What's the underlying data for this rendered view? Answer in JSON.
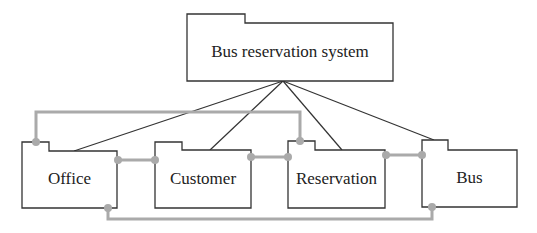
{
  "diagram": {
    "type": "package-diagram",
    "root": {
      "label": "Bus reservation system",
      "tab": {
        "x": 187,
        "y": 14,
        "w": 58,
        "h": 9
      },
      "body": {
        "x": 187,
        "y": 23,
        "w": 206,
        "h": 58
      }
    },
    "packages": [
      {
        "id": "office",
        "label": "Office",
        "tab": {
          "x": 22,
          "y": 142,
          "w": 27,
          "h": 9
        },
        "body": {
          "x": 22,
          "y": 151,
          "w": 95,
          "h": 57
        }
      },
      {
        "id": "customer",
        "label": "Customer",
        "tab": {
          "x": 155,
          "y": 142,
          "w": 27,
          "h": 8
        },
        "body": {
          "x": 155,
          "y": 150,
          "w": 96,
          "h": 58
        }
      },
      {
        "id": "reservation",
        "label": "Reservation",
        "tab": {
          "x": 288,
          "y": 141,
          "w": 27,
          "h": 9
        },
        "body": {
          "x": 288,
          "y": 150,
          "w": 97,
          "h": 58
        }
      },
      {
        "id": "bus",
        "label": "Bus",
        "tab": {
          "x": 422,
          "y": 140,
          "w": 26,
          "h": 10
        },
        "body": {
          "x": 422,
          "y": 150,
          "w": 95,
          "h": 57
        }
      }
    ],
    "containment_edges": [
      {
        "from": "root",
        "to": "office",
        "from_pt": [
          283,
          81
        ],
        "to_pt": [
          74,
          151
        ]
      },
      {
        "from": "root",
        "to": "customer",
        "from_pt": [
          283,
          81
        ],
        "to_pt": [
          210,
          150
        ]
      },
      {
        "from": "root",
        "to": "reservation",
        "from_pt": [
          283,
          81
        ],
        "to_pt": [
          342,
          150
        ]
      },
      {
        "from": "root",
        "to": "bus",
        "from_pt": [
          283,
          81
        ],
        "to_pt": [
          434,
          140
        ]
      }
    ],
    "dependency_edges": [
      {
        "from": "office",
        "to": "customer",
        "points": [
          [
            118,
            160
          ],
          [
            155,
            160
          ]
        ]
      },
      {
        "from": "customer",
        "to": "reservation",
        "points": [
          [
            251,
            157
          ],
          [
            288,
            157
          ]
        ]
      },
      {
        "from": "reservation",
        "to": "bus",
        "points": [
          [
            386,
            155
          ],
          [
            422,
            155
          ]
        ]
      },
      {
        "from": "office",
        "to": "reservation",
        "points": [
          [
            36,
            142
          ],
          [
            36,
            112
          ],
          [
            300,
            112
          ],
          [
            300,
            141
          ]
        ]
      },
      {
        "from": "office",
        "to": "bus",
        "points": [
          [
            108,
            208
          ],
          [
            108,
            219
          ],
          [
            432,
            219
          ],
          [
            432,
            207
          ]
        ]
      }
    ],
    "colors": {
      "outline": "#333333",
      "connector": "#aaaaaa",
      "text": "#222222"
    }
  }
}
